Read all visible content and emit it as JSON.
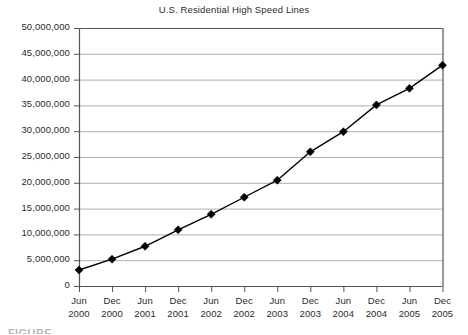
{
  "chart_data": {
    "type": "line",
    "title": "U.S. Residential High Speed Lines",
    "xlabel": "",
    "ylabel": "",
    "ylim": [
      0,
      50000000
    ],
    "grid": true,
    "legend": "none",
    "marker": "diamond",
    "categories": [
      "Jun 2000",
      "Dec 2000",
      "Jun 2001",
      "Dec 2001",
      "Jun 2002",
      "Dec 2002",
      "Jun 2003",
      "Dec 2003",
      "Jun 2004",
      "Dec 2004",
      "Jun 2005",
      "Dec 2005"
    ],
    "category_lines": [
      [
        "Jun",
        "2000"
      ],
      [
        "Dec",
        "2000"
      ],
      [
        "Jun",
        "2001"
      ],
      [
        "Dec",
        "2001"
      ],
      [
        "Jun",
        "2002"
      ],
      [
        "Dec",
        "2002"
      ],
      [
        "Jun",
        "2003"
      ],
      [
        "Dec",
        "2003"
      ],
      [
        "Jun",
        "2004"
      ],
      [
        "Dec",
        "2004"
      ],
      [
        "Jun",
        "2005"
      ],
      [
        "Dec",
        "2005"
      ]
    ],
    "values": [
      3100000,
      5200000,
      7700000,
      10900000,
      13900000,
      17200000,
      20500000,
      26000000,
      29900000,
      35100000,
      38300000,
      42800000
    ],
    "ytick_values": [
      0,
      5000000,
      10000000,
      15000000,
      20000000,
      25000000,
      30000000,
      35000000,
      40000000,
      45000000,
      50000000
    ],
    "ytick_labels": [
      "0",
      "5,000,000",
      "10,000,000",
      "15,000,000",
      "20,000,000",
      "25,000,000",
      "30,000,000",
      "35,000,000",
      "40,000,000",
      "45,000,000",
      "50,000,000"
    ],
    "colors": {
      "series_line": "#000000",
      "marker": "#000000",
      "gridline": "#9a9a9a",
      "axis": "#555555",
      "text": "#2b2b2b",
      "background": "#ffffff"
    }
  },
  "caption": {
    "partial_text": "FIGURE"
  }
}
